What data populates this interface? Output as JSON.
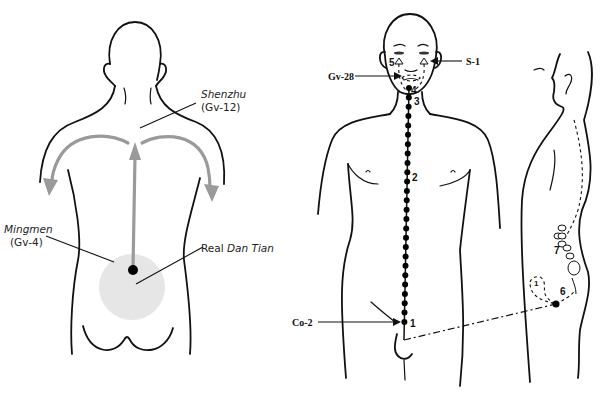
{
  "left_figure": {
    "title": "Back view — energy flow from Real Dan Tian",
    "labels": {
      "shenzhu_name": "Shenzhu",
      "shenzhu_code": "(Gv-12)",
      "mingmen_name": "Mingmen",
      "mingmen_code": "(Gv-4)",
      "dantian_prefix": "Real ",
      "dantian_name": "Dan Tian"
    },
    "colors": {
      "flow_arrow": "#9a9a9a",
      "dantian_fill": "#e6e6e6",
      "point": "#000000"
    }
  },
  "right_figure": {
    "title": "Governing vessel pathway — front and side view",
    "labels": {
      "gv28": "Gv-28",
      "s1": "S-1",
      "co2": "Co-2",
      "num_1": "1",
      "num_2": "2",
      "num_3": "3",
      "num_4": "4",
      "num_5": "5",
      "num_6": "6",
      "num_7": "7",
      "side_num_1": "1"
    }
  }
}
